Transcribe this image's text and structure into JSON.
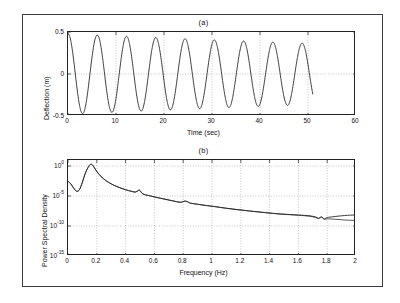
{
  "figure": {
    "panels": [
      {
        "title": "(a)",
        "xlabel": "Time (sec)",
        "ylabel": "Deflection (m)",
        "xticks": [
          "0",
          "10",
          "20",
          "30",
          "40",
          "50",
          "60"
        ],
        "yticks": [
          "0.5",
          "0",
          "-0.5"
        ]
      },
      {
        "title": "(b)",
        "xlabel": "Frequency (Hz)",
        "ylabel": "Power Spectral Density",
        "xticks": [
          "0",
          "0.2",
          "0.4",
          "0.6",
          "0.8",
          "1",
          "1.2",
          "1.4",
          "1.6",
          "1.8",
          "2"
        ],
        "yticks": [
          "10",
          "10",
          "10",
          "10"
        ],
        "yexponents": [
          "0",
          "-5",
          "-10",
          "-15"
        ]
      }
    ],
    "colors": {
      "trace": "#1b1b1b",
      "grid": "#8d8d8d",
      "axis": "#222222",
      "frame": "#3a3a4a",
      "background": "#ffffff"
    }
  },
  "chart_data": [
    {
      "type": "line",
      "title": "(a)",
      "xlabel": "Time (sec)",
      "ylabel": "Deflection (m)",
      "xlim": [
        0,
        60
      ],
      "ylim": [
        -0.5,
        0.5
      ],
      "xticks": [
        0,
        10,
        20,
        30,
        40,
        50,
        60
      ],
      "yticks": [
        -0.5,
        0,
        0.5
      ],
      "grid": true,
      "legend": "none",
      "description": "Lightly damped decaying sinusoid, amplitude 0.48 m decaying to about 0.36 m, period about 6.1 s (0.164 Hz), record ends at t = 51 s",
      "series": [
        {
          "name": "deflection",
          "model": "damped_sine",
          "amplitude0": 0.48,
          "decay_per_sec": 0.0055,
          "frequency_hz": 0.164,
          "phase_deg": 90,
          "t_start": 0,
          "t_end": 51
        }
      ]
    },
    {
      "type": "line",
      "title": "(b)",
      "xlabel": "Frequency (Hz)",
      "ylabel": "Power Spectral Density",
      "xlim": [
        0,
        2
      ],
      "ylim": [
        1e-15,
        10.0
      ],
      "yscale": "log",
      "xticks": [
        0,
        0.2,
        0.4,
        0.6,
        0.8,
        1,
        1.2,
        1.4,
        1.6,
        1.8,
        2
      ],
      "yticks": [
        1,
        1e-05,
        1e-10,
        1e-15
      ],
      "ytick_labels": [
        "10^0",
        "10^-5",
        "10^-10",
        "10^-15"
      ],
      "grid": true,
      "legend": "none",
      "description": "Spectral peak at 0.16 Hz reaching about 2, secondary bumps near 0.49 Hz and 0.82 Hz, monotonic roll-off with two nearly coincident traces that separate beyond 1.7 Hz",
      "series": [
        {
          "name": "psd-1",
          "x": [
            0.0,
            0.02,
            0.04,
            0.06,
            0.08,
            0.1,
            0.12,
            0.14,
            0.16,
            0.18,
            0.2,
            0.24,
            0.28,
            0.32,
            0.36,
            0.4,
            0.44,
            0.47,
            0.49,
            0.5,
            0.52,
            0.56,
            0.6,
            0.66,
            0.72,
            0.78,
            0.81,
            0.83,
            0.85,
            0.9,
            0.96,
            1.02,
            1.1,
            1.18,
            1.26,
            1.34,
            1.42,
            1.48,
            1.54,
            1.6,
            1.64,
            1.68,
            1.72,
            1.74,
            1.76,
            1.78,
            1.8,
            1.82,
            1.86,
            1.9,
            1.94,
            2.0
          ],
          "y": [
            0.003,
            0.001,
            0.0002,
            6e-05,
            0.00012,
            0.002,
            0.06,
            0.6,
            2.0,
            0.7,
            0.12,
            0.01,
            0.002,
            0.0006,
            0.00024,
            0.00011,
            6e-05,
            4.6e-05,
            9e-05,
            8e-05,
            2.2e-05,
            1.2e-05,
            7e-06,
            3.4e-06,
            1.7e-06,
            9e-07,
            1.4e-06,
            1.1e-06,
            6.5e-07,
            4.2e-07,
            2.6e-07,
            1.7e-07,
            9e-08,
            5.2e-08,
            3.2e-08,
            2e-08,
            1.3e-08,
            1e-08,
            8.2e-09,
            6.8e-09,
            6e-09,
            5e-09,
            3.2e-09,
            2e-09,
            3.4e-09,
            1.6e-09,
            2.6e-09,
            3e-09,
            4e-09,
            5e-09,
            6e-09,
            7e-09
          ]
        },
        {
          "name": "psd-2",
          "x": [
            0.0,
            0.02,
            0.04,
            0.06,
            0.08,
            0.1,
            0.12,
            0.14,
            0.16,
            0.18,
            0.2,
            0.24,
            0.28,
            0.32,
            0.36,
            0.4,
            0.44,
            0.47,
            0.49,
            0.5,
            0.52,
            0.56,
            0.6,
            0.66,
            0.72,
            0.78,
            0.81,
            0.83,
            0.85,
            0.9,
            0.96,
            1.02,
            1.1,
            1.18,
            1.26,
            1.34,
            1.42,
            1.48,
            1.54,
            1.6,
            1.64,
            1.68,
            1.72,
            1.74,
            1.76,
            1.78,
            1.8,
            1.82,
            1.86,
            1.9,
            1.94,
            2.0
          ],
          "y": [
            0.003,
            0.001,
            0.0002,
            6e-05,
            0.00012,
            0.002,
            0.06,
            0.6,
            2.0,
            0.7,
            0.12,
            0.01,
            0.002,
            0.0006,
            0.00024,
            0.00011,
            6e-05,
            4.6e-05,
            9e-05,
            8e-05,
            2.2e-05,
            1.2e-05,
            7e-06,
            3.4e-06,
            1.7e-06,
            9e-07,
            1.4e-06,
            1.1e-06,
            6.5e-07,
            4.2e-07,
            2.6e-07,
            1.7e-07,
            9e-08,
            5.2e-08,
            3.2e-08,
            2e-08,
            1.3e-08,
            9.5e-09,
            7.6e-09,
            6.2e-09,
            5.2e-09,
            4.2e-09,
            2.6e-09,
            1.7e-09,
            2.8e-09,
            1.3e-09,
            1.6e-09,
            1.5e-09,
            1.3e-09,
            1.1e-09,
            9.5e-10,
            8e-10
          ]
        }
      ]
    }
  ]
}
